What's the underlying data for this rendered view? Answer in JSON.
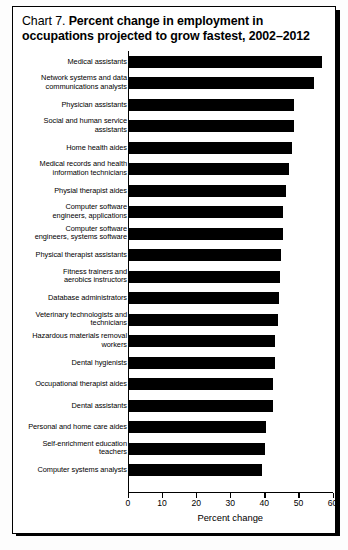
{
  "title": {
    "prefix": "Chart 7.",
    "main_line1": "Percent change in employment in",
    "main_line2": "occupations projected to grow fastest, 2002–2012"
  },
  "chart_data": {
    "type": "bar",
    "orientation": "horizontal",
    "title": "Chart 7. Percent change in employment in occupations projected to grow fastest, 2002–2012",
    "xlabel": "Percent change",
    "ylabel": "",
    "xlim": [
      0,
      60
    ],
    "xticks": [
      0,
      10,
      20,
      30,
      40,
      50,
      60
    ],
    "grid": false,
    "legend": false,
    "bar_color": "#000000",
    "categories": [
      "Medical assistants",
      "Network systems and data\ncommunications analysts",
      "Physician assistants",
      "Social and human service\nassistants",
      "Home health aides",
      "Medical records and health\ninformation technicians",
      "Physial therapist aides",
      "Computer software\nengineers, applications",
      "Computer software\nengineers, systems software",
      "Physical therapist assistants",
      "Fitness trainers and\naerobics instructors",
      "Database administrators",
      "Veterinary technologists and\ntechnicians",
      "Hazardous materials removal\nworkers",
      "Dental hygienists",
      "Occupational therapist aides",
      "Dental assistants",
      "Personal and home care aides",
      "Self-enrichment education\nteachers",
      "Computer systems analysts"
    ],
    "values": [
      57.0,
      54.6,
      48.8,
      48.7,
      48.1,
      47.1,
      46.3,
      45.5,
      45.5,
      45.0,
      44.5,
      44.2,
      44.1,
      43.1,
      43.1,
      42.6,
      42.5,
      40.5,
      40.3,
      39.4
    ]
  },
  "axis": {
    "tick_labels": [
      "0",
      "10",
      "20",
      "30",
      "40",
      "50",
      "60"
    ],
    "caption": "Percent change"
  }
}
